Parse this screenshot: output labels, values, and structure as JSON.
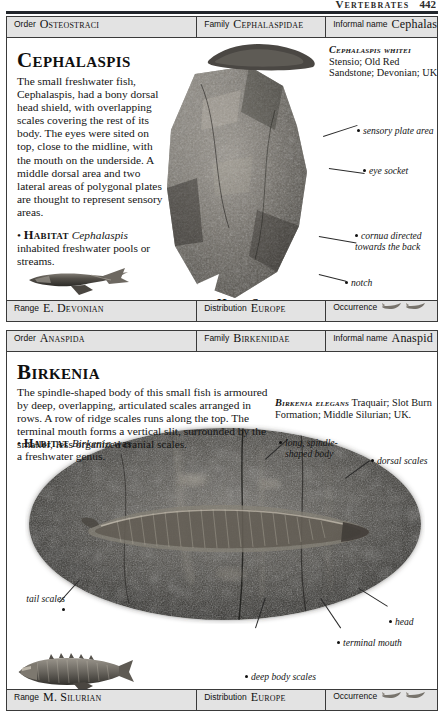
{
  "running_head": {
    "title": "Vertebrates",
    "page_number": "442"
  },
  "entries": [
    {
      "id": "cephalaspis",
      "header": {
        "order_label": "Order",
        "order_value": "Osteostraci",
        "family_label": "Family",
        "family_value": "Cephalaspidae",
        "informal_label": "Informal name",
        "informal_value": "Cephalaspid"
      },
      "title": "Cephalaspis",
      "body": "The small freshwater fish, Cephalaspis, had a bony dorsal head shield, with overlapping scales covering the rest of its body. The eyes were sited on top, close to the midline, with the mouth on the underside. A middle dorsal area and two lateral areas of polygonal plates are thought to represent sensory areas.",
      "body_italic_word": "Cephalaspis",
      "habitat_bullet": "•",
      "habitat_label": "Habitat",
      "habitat_genus": "Cephalaspis",
      "habitat_text": "inhabited freshwater pools or streams.",
      "specimen_caption": {
        "species": "Cephalaspis whitei",
        "details": "Stensio; Old Red Sandstone; Devonian; UK."
      },
      "annotations": [
        {
          "text": "sensory plate area"
        },
        {
          "text": "eye socket"
        },
        {
          "text": "cornua directed towards the back"
        },
        {
          "text": "notch"
        }
      ],
      "scale_note": "Typical length 22cm (8⅝in)",
      "plate_caption": "Head Shield",
      "footer": {
        "range_label": "Range",
        "range_value": "E. Devonian",
        "distribution_label": "Distribution",
        "distribution_value": "Europe",
        "occurrence_label": "Occurrence",
        "occurrence_icons": [
          "fish-icon",
          "fish-icon"
        ]
      }
    },
    {
      "id": "birkenia",
      "header": {
        "order_label": "Order",
        "order_value": "Anaspida",
        "family_label": "Family",
        "family_value": "Birkeniidae",
        "informal_label": "Informal name",
        "informal_value": "Anaspid"
      },
      "title": "Birkenia",
      "body": "The spindle-shaped body of this small fish is armoured by deep, overlapping, articulated scales arranged in rows. A row of ridge scales runs along the top. The terminal mouth forms a vertical slit, surrounded by the smaller, less organized cranial scales.",
      "habitat_bullet": "•",
      "habitat_label": "Habitat",
      "habitat_genus": "Birkenia",
      "habitat_text": "was a freshwater genus.",
      "specimen_caption": {
        "species": "Birkenia elegans",
        "details": "Traquair; Slot Burn Formation; Middle Silurian; UK."
      },
      "annotations": [
        {
          "text": "long, spindle-shaped body"
        },
        {
          "text": "dorsal scales"
        },
        {
          "text": "tail scales"
        },
        {
          "text": "head"
        },
        {
          "text": "terminal mouth"
        },
        {
          "text": "deep body scales"
        }
      ],
      "scale_note": "Typical length 6cm (2⅜in)",
      "footer": {
        "range_label": "Range",
        "range_value": "M. Silurian",
        "distribution_label": "Distribution",
        "distribution_value": "Europe",
        "occurrence_label": "Occurrence",
        "occurrence_icons": [
          "fish-icon",
          "fish-icon"
        ]
      }
    }
  ]
}
